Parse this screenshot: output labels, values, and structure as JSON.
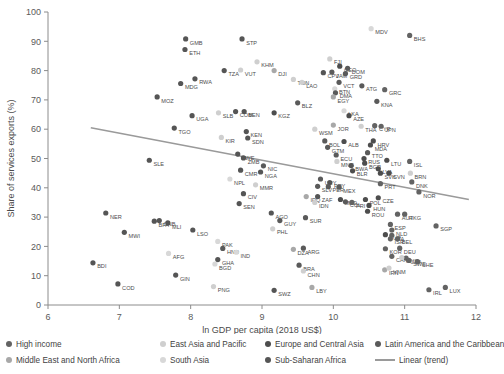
{
  "chart_data": {
    "type": "scatter",
    "title": "",
    "xlabel": "ln GDP per capita (2018 US$)",
    "ylabel": "Share of services exports (%)",
    "xlim": [
      6,
      12
    ],
    "ylim": [
      0,
      100
    ],
    "xticks": [
      6,
      7,
      8,
      9,
      10,
      11,
      12
    ],
    "yticks": [
      0,
      10,
      20,
      30,
      40,
      50,
      60,
      70,
      80,
      90,
      100
    ],
    "grid": false,
    "legend_position": "bottom",
    "groups": [
      {
        "name": "High income",
        "color": "#636363"
      },
      {
        "name": "East Asia and Pacific",
        "color": "#cfcfcf"
      },
      {
        "name": "Europe and Central Asia",
        "color": "#4d4d4d"
      },
      {
        "name": "Latin America and the Caribbean",
        "color": "#5a5a5a"
      },
      {
        "name": "Middle East and North Africa",
        "color": "#a8a8a8"
      },
      {
        "name": "South Asia",
        "color": "#d8d8d8"
      },
      {
        "name": "Sub-Saharan Africa",
        "color": "#555555"
      },
      {
        "name": "Linear (trend)",
        "color": "#9a9a9a",
        "is_line": true
      }
    ],
    "trend": {
      "label": "Linear (trend)",
      "x0": 6.6,
      "y0": 60.5,
      "x1": 11.9,
      "y1": 36.0
    },
    "points": [
      {
        "label": "GMB",
        "x": 7.93,
        "y": 90.8,
        "g": 6
      },
      {
        "label": "STP",
        "x": 8.72,
        "y": 90.8,
        "g": 6
      },
      {
        "label": "ETH",
        "x": 7.92,
        "y": 87.2,
        "g": 6
      },
      {
        "label": "KHM",
        "x": 8.93,
        "y": 83.0,
        "g": 1
      },
      {
        "label": "VUT",
        "x": 8.7,
        "y": 80.2,
        "g": 1
      },
      {
        "label": "DJI",
        "x": 9.17,
        "y": 80.0,
        "g": 4
      },
      {
        "label": "TZA",
        "x": 8.47,
        "y": 80.0,
        "g": 6
      },
      {
        "label": "MDG",
        "x": 7.86,
        "y": 75.6,
        "g": 6
      },
      {
        "label": "RWA",
        "x": 8.06,
        "y": 77.2,
        "g": 6
      },
      {
        "label": "TON",
        "x": 9.44,
        "y": 77.0,
        "g": 1
      },
      {
        "label": "MOZ",
        "x": 7.53,
        "y": 71.0,
        "g": 6
      },
      {
        "label": "CPV",
        "x": 9.86,
        "y": 79.3,
        "g": 6
      },
      {
        "label": "MDV",
        "x": 10.53,
        "y": 94.3,
        "g": 5
      },
      {
        "label": "BHS",
        "x": 11.07,
        "y": 92.0,
        "g": 0
      },
      {
        "label": "FJI",
        "x": 9.95,
        "y": 84.0,
        "g": 1
      },
      {
        "label": "JAM",
        "x": 9.98,
        "y": 79.5,
        "g": 3
      },
      {
        "label": "GEO",
        "x": 10.09,
        "y": 81.5,
        "g": 2
      },
      {
        "label": "DOM",
        "x": 10.2,
        "y": 80.8,
        "g": 3
      },
      {
        "label": "GRD",
        "x": 10.17,
        "y": 79.0,
        "g": 3
      },
      {
        "label": "UGA",
        "x": 8.02,
        "y": 64.6,
        "g": 6
      },
      {
        "label": "SLB",
        "x": 8.39,
        "y": 65.6,
        "g": 1
      },
      {
        "label": "TGO",
        "x": 7.77,
        "y": 60.4,
        "g": 6
      },
      {
        "label": "COM",
        "x": 8.63,
        "y": 66.0,
        "g": 6
      },
      {
        "label": "BEN",
        "x": 8.75,
        "y": 66.0,
        "g": 6
      },
      {
        "label": "KGZ",
        "x": 9.17,
        "y": 65.6,
        "g": 2
      },
      {
        "label": "KEN",
        "x": 8.78,
        "y": 59.2,
        "g": 6
      },
      {
        "label": "SDN",
        "x": 8.8,
        "y": 57.0,
        "g": 6
      },
      {
        "label": "KIR",
        "x": 8.43,
        "y": 57.2,
        "g": 1
      },
      {
        "label": "SLE",
        "x": 7.42,
        "y": 49.4,
        "g": 6
      },
      {
        "label": "ZWE",
        "x": 8.66,
        "y": 51.5,
        "g": 6
      },
      {
        "label": "ZMB",
        "x": 8.74,
        "y": 50.2,
        "g": 6
      },
      {
        "label": "NIC",
        "x": 9.02,
        "y": 47.5,
        "g": 3
      },
      {
        "label": "CMR",
        "x": 8.7,
        "y": 46.0,
        "g": 6
      },
      {
        "label": "NGA",
        "x": 8.98,
        "y": 45.4,
        "g": 6
      },
      {
        "label": "NPL",
        "x": 8.55,
        "y": 43.0,
        "g": 5
      },
      {
        "label": "MMR",
        "x": 8.91,
        "y": 41.0,
        "g": 1
      },
      {
        "label": "CIV",
        "x": 8.74,
        "y": 38.0,
        "g": 6
      },
      {
        "label": "SEN",
        "x": 8.68,
        "y": 34.6,
        "g": 6
      },
      {
        "label": "NER",
        "x": 6.81,
        "y": 31.4,
        "g": 6
      },
      {
        "label": "GNB",
        "x": 7.56,
        "y": 28.8,
        "g": 6
      },
      {
        "label": "BFA",
        "x": 7.49,
        "y": 28.6,
        "g": 6
      },
      {
        "label": "MLI",
        "x": 7.68,
        "y": 28.0,
        "g": 6
      },
      {
        "label": "MWI",
        "x": 7.07,
        "y": 24.8,
        "g": 6
      },
      {
        "label": "LSO",
        "x": 8.03,
        "y": 25.6,
        "g": 6
      },
      {
        "label": "PAK",
        "x": 8.38,
        "y": 21.7,
        "g": 5
      },
      {
        "label": "HND",
        "x": 8.45,
        "y": 19.3,
        "g": 3
      },
      {
        "label": "GHA",
        "x": 8.38,
        "y": 15.5,
        "g": 6
      },
      {
        "label": "BGD",
        "x": 8.34,
        "y": 14.0,
        "g": 5
      },
      {
        "label": "AFG",
        "x": 7.69,
        "y": 17.6,
        "g": 5
      },
      {
        "label": "BDI",
        "x": 6.63,
        "y": 14.4,
        "g": 6
      },
      {
        "label": "COD",
        "x": 6.98,
        "y": 7.2,
        "g": 6
      },
      {
        "label": "GIN",
        "x": 7.79,
        "y": 10.2,
        "g": 6
      },
      {
        "label": "PNG",
        "x": 8.32,
        "y": 6.3,
        "g": 1
      },
      {
        "label": "IND",
        "x": 8.64,
        "y": 18.0,
        "g": 5
      },
      {
        "label": "VCT",
        "x": 10.08,
        "y": 76.0,
        "g": 3
      },
      {
        "label": "BTN",
        "x": 10.02,
        "y": 73.8,
        "g": 5
      },
      {
        "label": "DMA",
        "x": 10.03,
        "y": 72.4,
        "g": 3
      },
      {
        "label": "EGY",
        "x": 10.0,
        "y": 71.0,
        "g": 4
      },
      {
        "label": "LAO",
        "x": 9.56,
        "y": 76.0,
        "g": 1
      },
      {
        "label": "BLZ",
        "x": 9.5,
        "y": 69.0,
        "g": 3
      },
      {
        "label": "ATG",
        "x": 10.4,
        "y": 74.8,
        "g": 3
      },
      {
        "label": "GRC",
        "x": 10.72,
        "y": 73.5,
        "g": 0
      },
      {
        "label": "KNA",
        "x": 10.61,
        "y": 69.5,
        "g": 3
      },
      {
        "label": "LKA",
        "x": 10.15,
        "y": 66.3,
        "g": 5
      },
      {
        "label": "AZE",
        "x": 10.22,
        "y": 64.6,
        "g": 2
      },
      {
        "label": "THA",
        "x": 10.39,
        "y": 61.0,
        "g": 1
      },
      {
        "label": "CYP",
        "x": 10.58,
        "y": 61.2,
        "g": 0
      },
      {
        "label": "JPN",
        "x": 10.67,
        "y": 61.0,
        "g": 0
      },
      {
        "label": "WSM",
        "x": 9.74,
        "y": 60.0,
        "g": 1
      },
      {
        "label": "JOR",
        "x": 10.0,
        "y": 61.4,
        "g": 4
      },
      {
        "label": "BOL",
        "x": 9.88,
        "y": 56.0,
        "g": 3
      },
      {
        "label": "GTM",
        "x": 9.92,
        "y": 53.8,
        "g": 3
      },
      {
        "label": "ALB",
        "x": 10.15,
        "y": 55.8,
        "g": 2
      },
      {
        "label": "HRV",
        "x": 10.56,
        "y": 56.0,
        "g": 2
      },
      {
        "label": "MDA",
        "x": 10.52,
        "y": 54.6,
        "g": 2
      },
      {
        "label": "ECU",
        "x": 10.04,
        "y": 51.2,
        "g": 3
      },
      {
        "label": "MNG",
        "x": 10.05,
        "y": 49.0,
        "g": 1
      },
      {
        "label": "TTO",
        "x": 10.48,
        "y": 52.0,
        "g": 3
      },
      {
        "label": "RUS",
        "x": 10.43,
        "y": 50.0,
        "g": 2
      },
      {
        "label": "BGR",
        "x": 10.44,
        "y": 48.4,
        "g": 2
      },
      {
        "label": "LTU",
        "x": 10.75,
        "y": 49.4,
        "g": 2
      },
      {
        "label": "ISL",
        "x": 11.07,
        "y": 49.0,
        "g": 0
      },
      {
        "label": "BWA",
        "x": 10.25,
        "y": 47.6,
        "g": 6
      },
      {
        "label": "BLR",
        "x": 10.27,
        "y": 45.8,
        "g": 2
      },
      {
        "label": "LVA",
        "x": 10.63,
        "y": 46.5,
        "g": 2
      },
      {
        "label": "SVK",
        "x": 10.66,
        "y": 45.0,
        "g": 2
      },
      {
        "label": "SVN",
        "x": 10.78,
        "y": 45.0,
        "g": 2
      },
      {
        "label": "BRN",
        "x": 11.08,
        "y": 45.0,
        "g": 1
      },
      {
        "label": "DNK",
        "x": 11.1,
        "y": 42.0,
        "g": 0
      },
      {
        "label": "PRT",
        "x": 10.66,
        "y": 41.4,
        "g": 0
      },
      {
        "label": "NOR",
        "x": 11.2,
        "y": 38.6,
        "g": 0
      },
      {
        "label": "PRY",
        "x": 9.95,
        "y": 41.8,
        "g": 3
      },
      {
        "label": "URY",
        "x": 9.82,
        "y": 43.0,
        "g": 3
      },
      {
        "label": "PER",
        "x": 9.93,
        "y": 40.4,
        "g": 3
      },
      {
        "label": "SLV",
        "x": 9.78,
        "y": 40.5,
        "g": 3
      },
      {
        "label": "MEX",
        "x": 10.08,
        "y": 40.2,
        "g": 3
      },
      {
        "label": "IRQ",
        "x": 9.62,
        "y": 37.0,
        "g": 4
      },
      {
        "label": "ZAF",
        "x": 9.78,
        "y": 37.0,
        "g": 6
      },
      {
        "label": "IDN",
        "x": 9.74,
        "y": 35.0,
        "g": 1
      },
      {
        "label": "MKD",
        "x": 10.1,
        "y": 36.0,
        "g": 2
      },
      {
        "label": "COL",
        "x": 10.17,
        "y": 35.2,
        "g": 3
      },
      {
        "label": "PRI",
        "x": 10.26,
        "y": 35.0,
        "g": 0
      },
      {
        "label": "POL",
        "x": 10.45,
        "y": 36.0,
        "g": 2
      },
      {
        "label": "CZE",
        "x": 10.63,
        "y": 36.6,
        "g": 2
      },
      {
        "label": "HUN",
        "x": 10.5,
        "y": 34.0,
        "g": 2
      },
      {
        "label": "ROU",
        "x": 10.48,
        "y": 32.0,
        "g": 2
      },
      {
        "label": "AGO",
        "x": 9.13,
        "y": 31.4,
        "g": 6
      },
      {
        "label": "GUY",
        "x": 9.25,
        "y": 28.8,
        "g": 3
      },
      {
        "label": "SUR",
        "x": 9.61,
        "y": 29.8,
        "g": 3
      },
      {
        "label": "AUT",
        "x": 10.9,
        "y": 31.0,
        "g": 0
      },
      {
        "label": "HKG",
        "x": 11.0,
        "y": 31.0,
        "g": 0
      },
      {
        "label": "PHL",
        "x": 9.15,
        "y": 26.0,
        "g": 1
      },
      {
        "label": "SGP",
        "x": 11.44,
        "y": 27.0,
        "g": 0
      },
      {
        "label": "ESP",
        "x": 10.8,
        "y": 27.5,
        "g": 0
      },
      {
        "label": "NLD",
        "x": 10.82,
        "y": 25.6,
        "g": 0
      },
      {
        "label": "TUR",
        "x": 10.73,
        "y": 24.0,
        "g": 2
      },
      {
        "label": "ITA",
        "x": 10.82,
        "y": 23.8,
        "g": 0
      },
      {
        "label": "ISR",
        "x": 10.8,
        "y": 22.6,
        "g": 0
      },
      {
        "label": "BEL",
        "x": 10.9,
        "y": 22.6,
        "g": 0
      },
      {
        "label": "DZA",
        "x": 9.44,
        "y": 19.0,
        "g": 4
      },
      {
        "label": "ARG",
        "x": 9.58,
        "y": 19.4,
        "g": 3
      },
      {
        "label": "KOR",
        "x": 10.73,
        "y": 19.2,
        "g": 0
      },
      {
        "label": "DEU",
        "x": 10.93,
        "y": 19.4,
        "g": 0
      },
      {
        "label": "CAN",
        "x": 10.82,
        "y": 16.6,
        "g": 0
      },
      {
        "label": "USA",
        "x": 11.02,
        "y": 16.0,
        "g": 0
      },
      {
        "label": "MYS",
        "x": 10.96,
        "y": 16.2,
        "g": 1
      },
      {
        "label": "SWE",
        "x": 11.06,
        "y": 15.2,
        "g": 0
      },
      {
        "label": "CHE",
        "x": 11.18,
        "y": 14.8,
        "g": 0
      },
      {
        "label": "BRA",
        "x": 9.52,
        "y": 13.6,
        "g": 3
      },
      {
        "label": "CHN",
        "x": 9.58,
        "y": 11.6,
        "g": 1
      },
      {
        "label": "IRN",
        "x": 10.72,
        "y": 12.0,
        "g": 4
      },
      {
        "label": "VNM",
        "x": 10.78,
        "y": 12.6,
        "g": 1
      },
      {
        "label": "LBY",
        "x": 9.7,
        "y": 6.0,
        "g": 4
      },
      {
        "label": "SWZ",
        "x": 9.17,
        "y": 5.0,
        "g": 6
      },
      {
        "label": "IRL",
        "x": 11.34,
        "y": 5.2,
        "g": 0
      },
      {
        "label": "LUX",
        "x": 11.57,
        "y": 6.0,
        "g": 0
      }
    ]
  }
}
